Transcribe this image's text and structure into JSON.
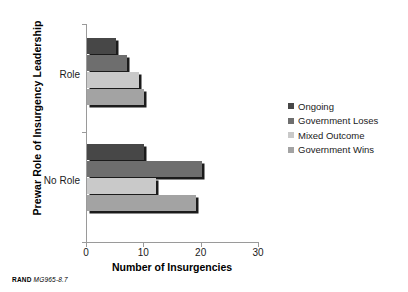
{
  "chart_data": {
    "type": "bar",
    "orientation": "horizontal",
    "title": "",
    "xlabel": "Number of Insurgencies",
    "ylabel": "Prewar Role of Insurgency Leadership",
    "categories": [
      "Role",
      "No Role"
    ],
    "xlim": [
      0,
      30
    ],
    "xticks": [
      0,
      10,
      20,
      30
    ],
    "xtick_labels": [
      "0",
      "10",
      "20",
      "30"
    ],
    "grid": false,
    "legend_position": "right",
    "series": [
      {
        "name": "Ongoing",
        "color": "#474747",
        "values": [
          5,
          10
        ]
      },
      {
        "name": "Government Loses",
        "color": "#6e6e6e",
        "values": [
          7,
          20
        ]
      },
      {
        "name": "Mixed Outcome",
        "color": "#c9c9c9",
        "values": [
          9,
          12
        ]
      },
      {
        "name": "Government Wins",
        "color": "#a3a3a3",
        "values": [
          10,
          19
        ]
      }
    ]
  },
  "footer": {
    "brand": "RAND",
    "figure_id": "MG965-8.7"
  }
}
